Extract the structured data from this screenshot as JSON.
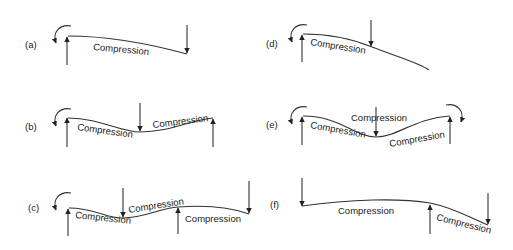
{
  "diagram": {
    "panels": [
      {
        "id": "a",
        "label": "(a)",
        "texts": [
          "Compression"
        ]
      },
      {
        "id": "b",
        "label": "(b)",
        "texts": [
          "Compression",
          "Compression"
        ]
      },
      {
        "id": "c",
        "label": "(c)",
        "texts": [
          "Compression",
          "Compression",
          "Compression"
        ]
      },
      {
        "id": "d",
        "label": "(d)",
        "texts": [
          "Compression"
        ]
      },
      {
        "id": "e",
        "label": "(e)",
        "texts": [
          "Compression",
          "Compression",
          "Compression"
        ]
      },
      {
        "id": "f",
        "label": "(f)",
        "texts": [
          "Compression",
          "Compression"
        ]
      }
    ],
    "colors": {
      "stroke": "#333333",
      "background": "#ffffff"
    }
  }
}
